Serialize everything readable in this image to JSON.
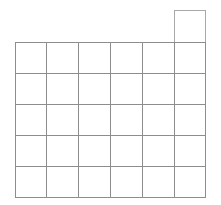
{
  "figure": {
    "background_color": "#ffffff",
    "width": 221,
    "height": 205
  },
  "chart_data": {
    "type": "table",
    "title": "",
    "subtitle": "",
    "xlabel": "",
    "ylabel": "",
    "grid": true,
    "legend": null,
    "columns": 6,
    "rows": 5,
    "extra_cells": 1,
    "total_cells": 31,
    "cell_width": 31.8,
    "cell_height": 31,
    "origin_x": 15,
    "origin_y": 42,
    "column_x": [
      15,
      46.8,
      78.6,
      110.4,
      142.2,
      174,
      205.8
    ],
    "row_y": [
      42,
      73,
      104,
      135,
      166,
      197
    ],
    "protruding_cell": {
      "column_index": 5,
      "x": 174,
      "y": 10.5,
      "width": 31.8,
      "height": 31.5
    },
    "categories": [
      "col-1",
      "col-2",
      "col-3",
      "col-4",
      "col-5",
      "col-6"
    ],
    "series": [
      {
        "name": "row-0",
        "values": [
          0,
          0,
          0,
          0,
          0,
          1
        ]
      },
      {
        "name": "row-1",
        "values": [
          1,
          1,
          1,
          1,
          1,
          1
        ]
      },
      {
        "name": "row-2",
        "values": [
          1,
          1,
          1,
          1,
          1,
          1
        ]
      },
      {
        "name": "row-3",
        "values": [
          1,
          1,
          1,
          1,
          1,
          1
        ]
      },
      {
        "name": "row-4",
        "values": [
          1,
          1,
          1,
          1,
          1,
          1
        ]
      },
      {
        "name": "row-5",
        "values": [
          1,
          1,
          1,
          1,
          1,
          1
        ]
      }
    ],
    "colors": {
      "cell_fill": "#ffffff",
      "main_stroke": "#8d8d8d",
      "protruding_stroke": "#a8a8a8"
    }
  }
}
